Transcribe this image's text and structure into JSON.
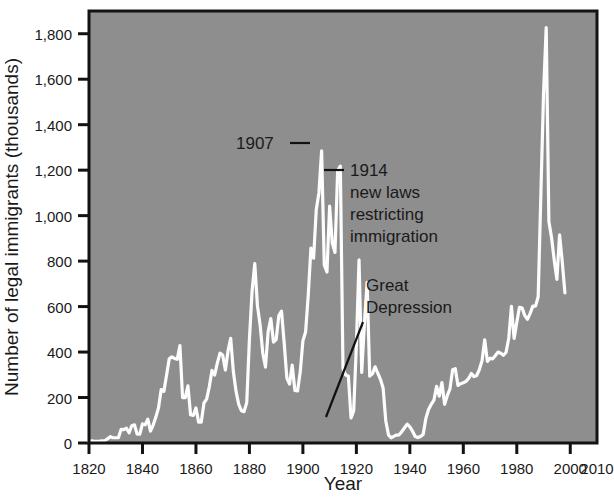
{
  "chart_data": {
    "type": "line",
    "title": "",
    "xlabel": "Year",
    "ylabel": "Number of legal immigrants (thousands)",
    "xlim": [
      1820,
      2010
    ],
    "ylim": [
      0,
      1900
    ],
    "xticks": [
      1820,
      1840,
      1860,
      1880,
      1900,
      1920,
      1940,
      1960,
      1980,
      2000,
      2010
    ],
    "xticklabels": [
      "1820",
      "1840",
      "1860",
      "1880",
      "1900",
      "1920",
      "1940",
      "1960",
      "1980",
      "2000",
      "2010"
    ],
    "yticks": [
      0,
      200,
      400,
      600,
      800,
      1000,
      1200,
      1400,
      1600,
      1800
    ],
    "yticklabels": [
      "0",
      "200",
      "400",
      "600",
      "800",
      "1,000",
      "1,200",
      "1,400",
      "1,600",
      "1,800"
    ],
    "grid": false,
    "legend": "none",
    "series_name": "Legal immigrants admitted",
    "series_color": "#fdfdfd",
    "plot_background": "#8e8e8e",
    "axis_color": "#131313",
    "x": [
      1820,
      1821,
      1822,
      1823,
      1824,
      1825,
      1826,
      1827,
      1828,
      1829,
      1830,
      1831,
      1832,
      1833,
      1834,
      1835,
      1836,
      1837,
      1838,
      1839,
      1840,
      1841,
      1842,
      1843,
      1844,
      1845,
      1846,
      1847,
      1848,
      1849,
      1850,
      1851,
      1852,
      1853,
      1854,
      1855,
      1856,
      1857,
      1858,
      1859,
      1860,
      1861,
      1862,
      1863,
      1864,
      1865,
      1866,
      1867,
      1868,
      1869,
      1870,
      1871,
      1872,
      1873,
      1874,
      1875,
      1876,
      1877,
      1878,
      1879,
      1880,
      1881,
      1882,
      1883,
      1884,
      1885,
      1886,
      1887,
      1888,
      1889,
      1890,
      1891,
      1892,
      1893,
      1894,
      1895,
      1896,
      1897,
      1898,
      1899,
      1900,
      1901,
      1902,
      1903,
      1904,
      1905,
      1906,
      1907,
      1908,
      1909,
      1910,
      1911,
      1912,
      1913,
      1914,
      1915,
      1916,
      1917,
      1918,
      1919,
      1920,
      1921,
      1922,
      1923,
      1924,
      1925,
      1926,
      1927,
      1928,
      1929,
      1930,
      1931,
      1932,
      1933,
      1934,
      1935,
      1936,
      1937,
      1938,
      1939,
      1940,
      1941,
      1942,
      1943,
      1944,
      1945,
      1946,
      1947,
      1948,
      1949,
      1950,
      1951,
      1952,
      1953,
      1954,
      1955,
      1956,
      1957,
      1958,
      1959,
      1960,
      1961,
      1962,
      1963,
      1964,
      1965,
      1966,
      1967,
      1968,
      1969,
      1970,
      1971,
      1972,
      1973,
      1974,
      1975,
      1976,
      1977,
      1978,
      1979,
      1980,
      1981,
      1982,
      1983,
      1984,
      1985,
      1986,
      1987,
      1988,
      1989,
      1990,
      1991,
      1992,
      1993,
      1994,
      1995,
      1996,
      1997,
      1998
    ],
    "y": [
      8,
      10,
      7,
      7,
      8,
      10,
      11,
      19,
      28,
      23,
      23,
      23,
      60,
      59,
      65,
      45,
      76,
      80,
      39,
      39,
      84,
      80,
      105,
      52,
      79,
      114,
      155,
      235,
      227,
      298,
      370,
      379,
      372,
      368,
      428,
      200,
      200,
      251,
      124,
      121,
      154,
      92,
      92,
      176,
      193,
      248,
      319,
      299,
      352,
      395,
      387,
      321,
      405,
      460,
      313,
      227,
      170,
      142,
      138,
      178,
      457,
      669,
      789,
      603,
      519,
      395,
      334,
      490,
      547,
      444,
      455,
      560,
      580,
      440,
      285,
      259,
      343,
      231,
      229,
      312,
      449,
      488,
      649,
      857,
      813,
      1026,
      1101,
      1285,
      783,
      752,
      1042,
      879,
      838,
      1198,
      1218,
      327,
      299,
      295,
      110,
      141,
      430,
      805,
      310,
      523,
      707,
      294,
      304,
      335,
      307,
      280,
      242,
      97,
      36,
      23,
      29,
      35,
      36,
      50,
      67,
      83,
      71,
      52,
      29,
      24,
      29,
      38,
      109,
      147,
      170,
      188,
      249,
      206,
      266,
      170,
      208,
      238,
      322,
      327,
      253,
      261,
      265,
      271,
      284,
      306,
      292,
      297,
      323,
      362,
      454,
      359,
      373,
      370,
      385,
      400,
      395,
      386,
      399,
      462,
      601,
      460,
      531,
      597,
      594,
      560,
      544,
      570,
      602,
      602,
      643,
      1091,
      1536,
      1827,
      974,
      904,
      804,
      720,
      916,
      798,
      660
    ]
  },
  "annotations": [
    {
      "id": "peak-1907",
      "text": "1907"
    },
    {
      "id": "laws-1914",
      "line1": "1914",
      "line2": "new laws",
      "line3": "restricting",
      "line4": "immigration"
    },
    {
      "id": "great-depression",
      "line1": "Great",
      "line2": "Depression"
    }
  ]
}
